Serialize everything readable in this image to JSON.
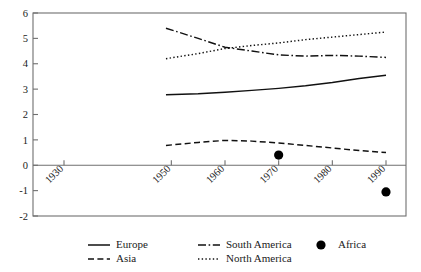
{
  "chart_data": {
    "type": "line",
    "title": "",
    "xlabel": "",
    "ylabel": "",
    "xlim": [
      1925,
      1995
    ],
    "ylim": [
      -2,
      6
    ],
    "grid": false,
    "legend_position": "bottom",
    "x_tick_labels": [
      "1930",
      "1950",
      "1960",
      "1970",
      "1980",
      "1990"
    ],
    "x_tick_values": [
      1930,
      1950,
      1960,
      1970,
      1980,
      1990
    ],
    "y_tick_labels": [
      "6",
      "5",
      "4",
      "3",
      "2",
      "1",
      "0",
      "-1",
      "-2"
    ],
    "y_tick_values": [
      6,
      5,
      4,
      3,
      2,
      1,
      0,
      -1,
      -2
    ],
    "series": [
      {
        "name": "Europe",
        "style": "solid",
        "x": [
          1949,
          1955,
          1960,
          1965,
          1970,
          1975,
          1980,
          1985,
          1990
        ],
        "values": [
          2.78,
          2.82,
          2.88,
          2.95,
          3.03,
          3.13,
          3.26,
          3.42,
          3.55
        ]
      },
      {
        "name": "Asia",
        "style": "dashed",
        "x": [
          1949,
          1955,
          1960,
          1965,
          1970,
          1975,
          1980,
          1985,
          1990
        ],
        "values": [
          0.78,
          0.9,
          0.98,
          0.95,
          0.88,
          0.78,
          0.68,
          0.58,
          0.5
        ]
      },
      {
        "name": "South America",
        "style": "dash-dot",
        "x": [
          1949,
          1955,
          1960,
          1965,
          1970,
          1975,
          1980,
          1985,
          1990
        ],
        "values": [
          5.4,
          5.0,
          4.65,
          4.5,
          4.35,
          4.3,
          4.33,
          4.3,
          4.25
        ]
      },
      {
        "name": "North America",
        "style": "dotted",
        "x": [
          1949,
          1955,
          1960,
          1965,
          1970,
          1975,
          1980,
          1985,
          1990
        ],
        "values": [
          4.2,
          4.4,
          4.6,
          4.72,
          4.82,
          4.95,
          5.05,
          5.15,
          5.25
        ]
      },
      {
        "name": "Africa",
        "style": "markers",
        "x": [
          1970,
          1990
        ],
        "values": [
          0.4,
          -1.05
        ]
      }
    ]
  },
  "legend": {
    "entries": [
      {
        "label": "Europe",
        "style": "solid"
      },
      {
        "label": "Asia",
        "style": "dashed"
      },
      {
        "label": "South America",
        "style": "dash-dot"
      },
      {
        "label": "North America",
        "style": "dotted"
      },
      {
        "label": "Africa",
        "style": "markers"
      }
    ]
  },
  "colors": {
    "line": "#111111",
    "axis": "#6f6f6f",
    "text": "#1a1a1a",
    "background": "#ffffff"
  }
}
